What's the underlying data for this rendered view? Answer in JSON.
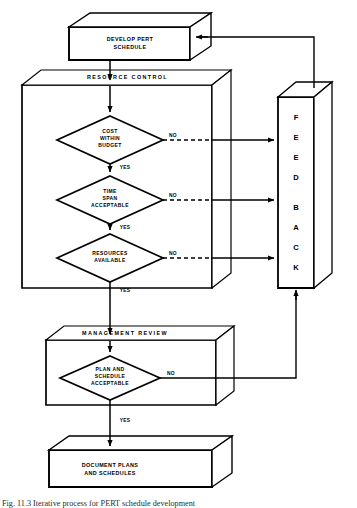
{
  "diagram": {
    "background_color": "#ffffff",
    "line_color": "#000000"
  },
  "nodes": {
    "develop": {
      "name": "develop-pert-schedule",
      "line1": "DEVELOP PERT",
      "line2": "SCHEDULE"
    },
    "resource_control": {
      "name": "resource-control-container",
      "label": "RESOURCE   CONTROL"
    },
    "management_review": {
      "name": "management-review-container",
      "label": "MANAGEMENT   REVIEW"
    },
    "document": {
      "name": "document-plans",
      "line1": "DOCUMENT PLANS",
      "line2": "AND SCHEDULES"
    },
    "feedback": {
      "name": "feedback-box",
      "label": "FEEDBACK",
      "letters": [
        "F",
        "E",
        "E",
        "D",
        "B",
        "A",
        "C",
        "K"
      ]
    }
  },
  "decisions": [
    {
      "id": "cost",
      "lines": [
        "COST",
        "WITHIN",
        "BUDGET"
      ],
      "yes": "YES",
      "no": "NO"
    },
    {
      "id": "time",
      "lines": [
        "TIME",
        "SPAN",
        "ACCEPTABLE"
      ],
      "yes": "YES",
      "no": "NO"
    },
    {
      "id": "resources",
      "lines": [
        "RESOURCES",
        "AVAILABLE"
      ],
      "yes": "YES",
      "no": "NO"
    },
    {
      "id": "plan",
      "lines": [
        "PLAN AND",
        "SCHEDULE",
        "ACCEPTABLE"
      ],
      "yes": "YES",
      "no": "NO"
    }
  ],
  "branch_labels": {
    "no1": "NO",
    "no2": "NO",
    "no3": "NO",
    "no4": "NO",
    "yes1": "YES",
    "yes2": "YES",
    "yes3": "YES",
    "yes4": "YES"
  },
  "caption": {
    "text": "Fig. 11.3  Iterative process for PERT schedule development"
  }
}
